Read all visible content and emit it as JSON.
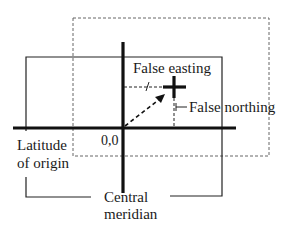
{
  "labels": {
    "false_easting": "False easting",
    "false_northing": "False northing",
    "origin": "0,0",
    "latitude_of_origin_line1": "Latitude",
    "latitude_of_origin_line2": "of origin",
    "central_meridian_line1": "Central",
    "central_meridian_line2": "meridian"
  },
  "colors": {
    "line": "#111111",
    "dashed": "#555555",
    "background": "#ffffff"
  }
}
